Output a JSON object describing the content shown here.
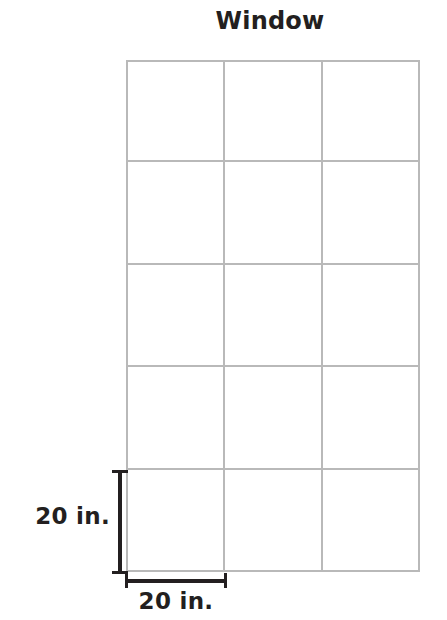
{
  "figure": {
    "title": "Window",
    "background_color": "#ffffff",
    "grid_line_color": "#b9b9b9",
    "dimension_color": "#231f20",
    "grid": {
      "columns": 3,
      "rows": 5,
      "total_panes": 15
    },
    "dimensions": {
      "height_label": "20 in.",
      "width_label": "20 in."
    }
  }
}
